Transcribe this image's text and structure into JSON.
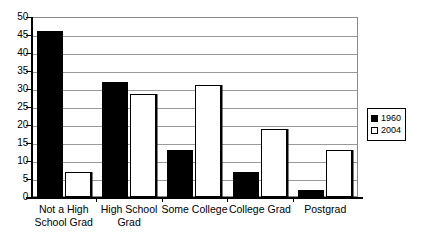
{
  "chart_data": {
    "type": "bar",
    "title": "",
    "subtitle": "",
    "xlabel": "",
    "ylabel": "",
    "ylim": [
      0,
      50
    ],
    "ytick_step": 5,
    "yticks": [
      0,
      5,
      10,
      15,
      20,
      25,
      30,
      35,
      40,
      45,
      50
    ],
    "grid": true,
    "grid_axis": "y",
    "legend_position": "right",
    "categories": [
      "Not a High School Grad",
      "High School Grad",
      "Some College",
      "College Grad",
      "Postgrad"
    ],
    "category_lines": [
      [
        "Not a High",
        "School Grad"
      ],
      [
        "High School",
        "Grad"
      ],
      [
        "Some College"
      ],
      [
        "College Grad"
      ],
      [
        "Postgrad"
      ]
    ],
    "series": [
      {
        "name": "1960",
        "color": "#000000",
        "fill": "solid",
        "values": [
          46,
          32,
          13,
          7,
          2
        ]
      },
      {
        "name": "2004",
        "color": "#ffffff",
        "fill": "open",
        "values": [
          7,
          28.5,
          31,
          19,
          13
        ]
      }
    ]
  },
  "legend": {
    "entries": [
      {
        "label": "1960",
        "swatch": "filled"
      },
      {
        "label": "2004",
        "swatch": "open"
      }
    ]
  }
}
